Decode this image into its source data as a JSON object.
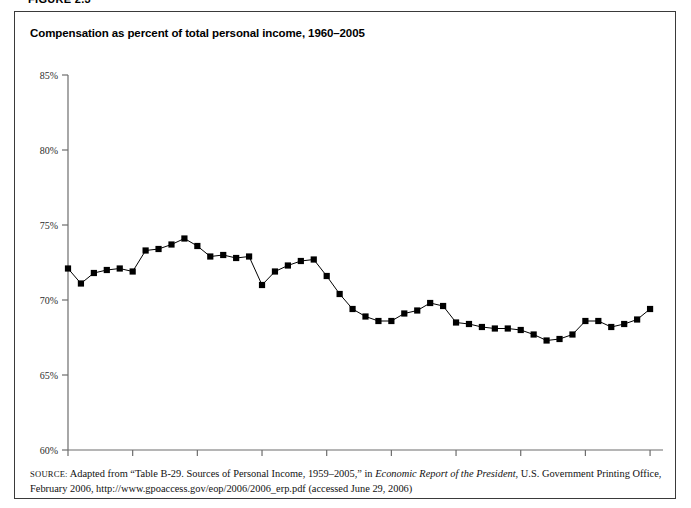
{
  "figure": {
    "label": "FIGURE 2.3",
    "title": "Compensation as percent of total personal income, 1960–2005"
  },
  "source": {
    "prefix": "SOURCE:",
    "line1_a": " Adapted from “Table B-29. Sources of Personal Income, 1959–2005,” in ",
    "line1_italic": "Economic Report of the President",
    "line1_b": ", U.S. Government Printing Office,",
    "line2": "February 2006, http://www.gpoaccess.gov/eop/2006/2006_erp.pdf (accessed June 29, 2006)"
  },
  "chart_data": {
    "type": "line",
    "title": "Compensation as percent of total personal income, 1960–2005",
    "xlabel": "",
    "ylabel": "",
    "xlim": [
      1960,
      2006
    ],
    "ylim": [
      60,
      85
    ],
    "ytick_values": [
      60,
      65,
      70,
      75,
      80,
      85
    ],
    "ytick_labels": [
      "60%",
      "65%",
      "70%",
      "75%",
      "80%",
      "85%"
    ],
    "xtick_values": [
      1960,
      1965,
      1970,
      1975,
      1980,
      1985,
      1990,
      1995,
      2000,
      2005
    ],
    "xtick_labels": [
      "1960",
      "1965",
      "1970",
      "1975",
      "1980",
      "1985",
      "1990",
      "1995",
      "2000",
      "2005"
    ],
    "grid": false,
    "legend": null,
    "marker": "square",
    "series": [
      {
        "name": "Compensation as percent of total personal income",
        "x": [
          1960,
          1961,
          1962,
          1963,
          1964,
          1965,
          1966,
          1967,
          1968,
          1969,
          1970,
          1971,
          1972,
          1973,
          1974,
          1975,
          1976,
          1977,
          1978,
          1979,
          1980,
          1981,
          1982,
          1983,
          1984,
          1985,
          1986,
          1987,
          1988,
          1989,
          1990,
          1991,
          1992,
          1993,
          1994,
          1995,
          1996,
          1997,
          1998,
          1999,
          2000,
          2001,
          2002,
          2003,
          2004,
          2005
        ],
        "values": [
          72.1,
          71.1,
          71.8,
          72.0,
          72.1,
          71.9,
          73.3,
          73.4,
          73.7,
          74.1,
          73.6,
          72.9,
          73.0,
          72.8,
          72.9,
          71.0,
          71.9,
          72.3,
          72.6,
          72.7,
          71.6,
          70.4,
          69.4,
          68.9,
          68.6,
          68.6,
          69.1,
          69.3,
          69.8,
          69.6,
          68.5,
          68.4,
          68.2,
          68.1,
          68.1,
          68.0,
          67.7,
          67.3,
          67.4,
          67.7,
          68.6,
          68.6,
          68.2,
          68.4,
          68.7,
          69.4
        ]
      }
    ]
  }
}
